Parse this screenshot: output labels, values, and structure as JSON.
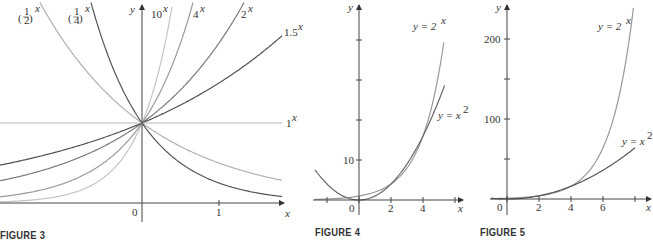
{
  "chart_data": [
    {
      "id": "figure3",
      "type": "line",
      "caption": "FIGURE 3",
      "title": "",
      "xlabel": "x",
      "ylabel": "y",
      "xlim": [
        -1.84,
        1.82
      ],
      "ylim": [
        0,
        1.52
      ],
      "x_ticks": [
        {
          "value": 0,
          "label": "0"
        },
        {
          "value": 1,
          "label": "1"
        }
      ],
      "y_ticks": [],
      "grid": false,
      "legend": "inline labels",
      "series": [
        {
          "name": "(1/2)^x",
          "base": 0.5,
          "color": "#b0b0b0",
          "label_base": "(1/2)",
          "label_exp": "x"
        },
        {
          "name": "(1/4)^x",
          "base": 0.25,
          "color": "#555555",
          "label_base": "(1/4)",
          "label_exp": "x"
        },
        {
          "name": "10^x",
          "base": 10,
          "color": "#c4c4c4",
          "label_base": "10",
          "label_exp": "x"
        },
        {
          "name": "4^x",
          "base": 4,
          "color": "#9a9a9a",
          "label_base": "4",
          "label_exp": "x"
        },
        {
          "name": "2^x",
          "base": 2,
          "color": "#7a7a7a",
          "label_base": "2",
          "label_exp": "x"
        },
        {
          "name": "1.5^x",
          "base": 1.5,
          "color": "#505050",
          "label_base": "1.5",
          "label_exp": "x"
        },
        {
          "name": "1^x",
          "base": 1,
          "color": "#b8b8b8",
          "label_base": "1",
          "label_exp": "x"
        }
      ]
    },
    {
      "id": "figure4",
      "type": "line",
      "caption": "FIGURE 4",
      "xlabel": "x",
      "ylabel": "y",
      "xlim": [
        -2.6,
        5.6
      ],
      "ylim": [
        -1,
        40
      ],
      "x_ticks": [
        {
          "value": -2,
          "label": ""
        },
        {
          "value": 0,
          "label": "0"
        },
        {
          "value": 2,
          "label": "2"
        },
        {
          "value": 4,
          "label": "4"
        },
        {
          "value": 6,
          "label": ""
        }
      ],
      "y_ticks": [
        {
          "value": 10,
          "label": "10"
        },
        {
          "value": 20,
          "label": ""
        },
        {
          "value": 30,
          "label": ""
        },
        {
          "value": 40,
          "label": ""
        }
      ],
      "grid": false,
      "series": [
        {
          "name": "y = 2^x",
          "fn": "2^x",
          "color": "#999999",
          "label": "y = 2",
          "label_exp": "x",
          "x_range": [
            -2.6,
            5.3
          ]
        },
        {
          "name": "y = x^2",
          "fn": "x^2",
          "color": "#666666",
          "label": "y = x",
          "label_exp": "2",
          "x_range": [
            -2.6,
            5.3
          ]
        }
      ],
      "intersections": [
        [
          2,
          4
        ],
        [
          4,
          16
        ]
      ]
    },
    {
      "id": "figure5",
      "type": "line",
      "caption": "FIGURE 5",
      "xlabel": "x",
      "ylabel": "y",
      "xlim": [
        -0.5,
        8.8
      ],
      "ylim": [
        0,
        240
      ],
      "x_ticks": [
        {
          "value": 0,
          "label": "0"
        },
        {
          "value": 2,
          "label": "2"
        },
        {
          "value": 4,
          "label": "4"
        },
        {
          "value": 6,
          "label": "6"
        },
        {
          "value": 8,
          "label": ""
        }
      ],
      "y_ticks": [
        {
          "value": 50,
          "label": ""
        },
        {
          "value": 100,
          "label": "100"
        },
        {
          "value": 150,
          "label": ""
        },
        {
          "value": 200,
          "label": "200"
        }
      ],
      "grid": false,
      "series": [
        {
          "name": "y = 2^x",
          "fn": "2^x",
          "color": "#999999",
          "label": "y = 2",
          "label_exp": "x",
          "x_range": [
            -0.5,
            7.9
          ]
        },
        {
          "name": "y = x^2",
          "fn": "x^2",
          "color": "#555555",
          "label": "y = x",
          "label_exp": "2",
          "x_range": [
            -0.5,
            8.0
          ]
        }
      ]
    }
  ],
  "captions": {
    "fig3": "FIGURE 3",
    "fig4": "FIGURE 4",
    "fig5": "FIGURE 5"
  },
  "labels": {
    "fig3": {
      "y": "y",
      "x": "x",
      "zero": "0",
      "one": "1",
      "half_base": "1",
      "half_den": "2",
      "quarter_base": "1",
      "quarter_den": "4",
      "ten": "10",
      "four": "4",
      "two": "2",
      "onefive": "1.5",
      "unit": "1",
      "exp": "x"
    },
    "fig4": {
      "y": "y",
      "x": "x",
      "zero": "0",
      "two": "2",
      "four": "4",
      "ten": "10",
      "exp_label": "y = 2",
      "exp_sup": "x",
      "pow_label": "y = x",
      "pow_sup": "2"
    },
    "fig5": {
      "y": "y",
      "x": "x",
      "zero": "0",
      "two": "2",
      "four": "4",
      "six": "6",
      "hundred": "100",
      "twohundred": "200",
      "exp_label": "y = 2",
      "exp_sup": "x",
      "pow_label": "y = x",
      "pow_sup": "2"
    }
  }
}
